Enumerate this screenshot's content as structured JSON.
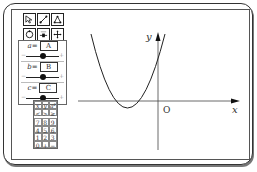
{
  "toolbar": {
    "tools": [
      {
        "name": "select-arrow-icon"
      },
      {
        "name": "line-segment-icon"
      },
      {
        "name": "polygon-icon"
      },
      {
        "name": "circle-icon"
      },
      {
        "name": "slider-icon"
      },
      {
        "name": "move-icon"
      }
    ]
  },
  "params": [
    {
      "name": "a",
      "label": "a",
      "eq": "=",
      "value": "A",
      "knob_pct": 0.55
    },
    {
      "name": "b",
      "label": "b",
      "eq": "=",
      "value": "B",
      "knob_pct": 0.55
    },
    {
      "name": "c",
      "label": "c",
      "eq": "=",
      "value": "C",
      "knob_pct": 0.55
    }
  ],
  "slider": {
    "minus": "−",
    "plus": "+"
  },
  "keypad": {
    "rows": [
      [
        "x",
        "y",
        "a²"
      ],
      [
        "<",
        ">",
        "≥"
      ],
      [
        "7",
        "8",
        "9"
      ],
      [
        "4",
        "5",
        "6"
      ],
      [
        "1",
        "2",
        "3"
      ],
      [
        "0",
        "+",
        "−"
      ]
    ]
  },
  "graph": {
    "x_label": "x",
    "y_label": "y",
    "origin_label": "O",
    "curve": "parabola opening upward, vertex left of y-axis below x-axis"
  }
}
